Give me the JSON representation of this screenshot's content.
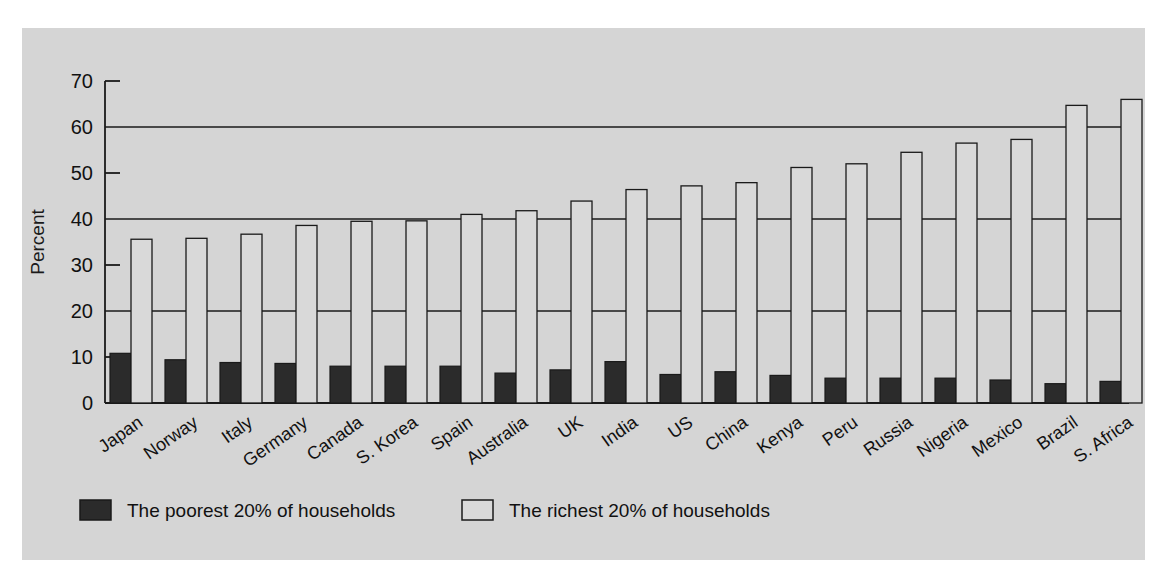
{
  "chart_data": {
    "type": "bar",
    "title": "",
    "subtitle": "",
    "xlabel": "",
    "ylabel": "Percent",
    "ylim": [
      0,
      70
    ],
    "ytick_step": 10,
    "yticks": [
      0,
      10,
      20,
      30,
      40,
      50,
      60,
      70
    ],
    "gridlines_at": [
      20,
      40,
      60
    ],
    "grid": true,
    "legend_position": "bottom",
    "orientation": "vertical",
    "categories": [
      "Japan",
      "Norway",
      "Italy",
      "Germany",
      "Canada",
      "S. Korea",
      "Spain",
      "Australia",
      "UK",
      "India",
      "US",
      "China",
      "Kenya",
      "Peru",
      "Russia",
      "Nigeria",
      "Mexico",
      "Brazil",
      "S. Africa"
    ],
    "series": [
      {
        "name": "The poorest 20% of households",
        "color": "#2b2b2b",
        "values": [
          10.8,
          9.4,
          8.8,
          8.6,
          8.0,
          8.0,
          8.0,
          6.5,
          7.2,
          9.0,
          6.2,
          6.8,
          6.0,
          5.4,
          5.4,
          5.4,
          5.0,
          4.2,
          4.7
        ]
      },
      {
        "name": "The richest 20% of households",
        "color": "#d9d9d9",
        "values": [
          35.6,
          35.8,
          36.7,
          38.6,
          39.5,
          39.6,
          41.0,
          41.8,
          43.9,
          46.4,
          47.2,
          47.9,
          51.2,
          52.0,
          54.5,
          56.5,
          57.3,
          64.7,
          66.0
        ]
      }
    ]
  },
  "axis": {
    "y_title": "Percent"
  },
  "legend": {
    "items": [
      {
        "label": "The poorest 20% of households",
        "swatch": "dark"
      },
      {
        "label": "The richest 20% of households",
        "swatch": "light"
      }
    ]
  },
  "colors": {
    "panel_background": "#d5d5d5",
    "page_background": "#ffffff",
    "axis_line": "#1a1a1a",
    "grid_line": "#1a1a1a",
    "poorest_fill": "#2b2b2b",
    "richest_fill": "#d9d9d9",
    "bar_stroke": "#1a1a1a"
  }
}
